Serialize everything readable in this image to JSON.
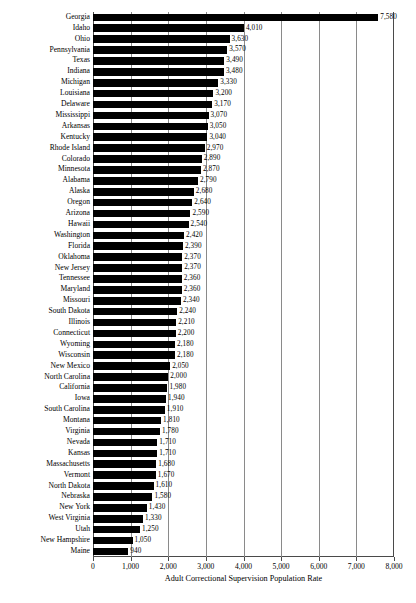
{
  "chart_data": {
    "type": "bar",
    "orientation": "horizontal",
    "title": "",
    "xlabel": "Adult Correctional Supervision Population Rate",
    "ylabel": "",
    "xlim": [
      0,
      8000
    ],
    "xticks": [
      0,
      1000,
      2000,
      3000,
      4000,
      5000,
      6000,
      7000,
      8000
    ],
    "xtick_labels": [
      "0",
      "1,000",
      "2,000",
      "3,000",
      "4,000",
      "5,000",
      "6,000",
      "7,000",
      "8,000"
    ],
    "grid": true,
    "grid_axis": "x",
    "legend": null,
    "bar_color": "#000000",
    "categories": [
      "Georgia",
      "Idaho",
      "Ohio",
      "Pennsylvania",
      "Texas",
      "Indiana",
      "Michigan",
      "Louisiana",
      "Delaware",
      "Mississippi",
      "Arkansas",
      "Kentucky",
      "Rhode Island",
      "Colorado",
      "Minnesota",
      "Alabama",
      "Alaska",
      "Oregon",
      "Arizona",
      "Hawaii",
      "Washington",
      "Florida",
      "Oklahoma",
      "New Jersey",
      "Tennessee",
      "Maryland",
      "Missouri",
      "South Dakota",
      "Illinois",
      "Connecticut",
      "Wyoming",
      "Wisconsin",
      "New Mexico",
      "North Carolina",
      "California",
      "Iowa",
      "South Carolina",
      "Montana",
      "Virginia",
      "Nevada",
      "Kansas",
      "Massachusetts",
      "Vermont",
      "North Dakota",
      "Nebraska",
      "New York",
      "West Virginia",
      "Utah",
      "New Hampshire",
      "Maine"
    ],
    "values": [
      7580,
      4010,
      3630,
      3570,
      3490,
      3480,
      3330,
      3200,
      3170,
      3070,
      3050,
      3040,
      2970,
      2890,
      2870,
      2790,
      2680,
      2640,
      2590,
      2540,
      2420,
      2390,
      2370,
      2370,
      2360,
      2360,
      2340,
      2240,
      2210,
      2200,
      2180,
      2180,
      2050,
      2000,
      1980,
      1940,
      1910,
      1810,
      1780,
      1710,
      1710,
      1680,
      1670,
      1610,
      1580,
      1430,
      1330,
      1250,
      1050,
      940
    ],
    "value_labels": [
      "7,580",
      "4,010",
      "3,630",
      "3,570",
      "3,490",
      "3,480",
      "3,330",
      "3,200",
      "3,170",
      "3,070",
      "3,050",
      "3,040",
      "2,970",
      "2,890",
      "2,870",
      "2,790",
      "2,680",
      "2,640",
      "2,590",
      "2,540",
      "2,420",
      "2,390",
      "2,370",
      "2,370",
      "2,360",
      "2,360",
      "2,340",
      "2,240",
      "2,210",
      "2,200",
      "2,180",
      "2,180",
      "2,050",
      "2,000",
      "1,980",
      "1,940",
      "1,910",
      "1,810",
      "1,780",
      "1,710",
      "1,710",
      "1,680",
      "1,670",
      "1,610",
      "1,580",
      "1,430",
      "1,330",
      "1,250",
      "1,050",
      "940"
    ]
  }
}
